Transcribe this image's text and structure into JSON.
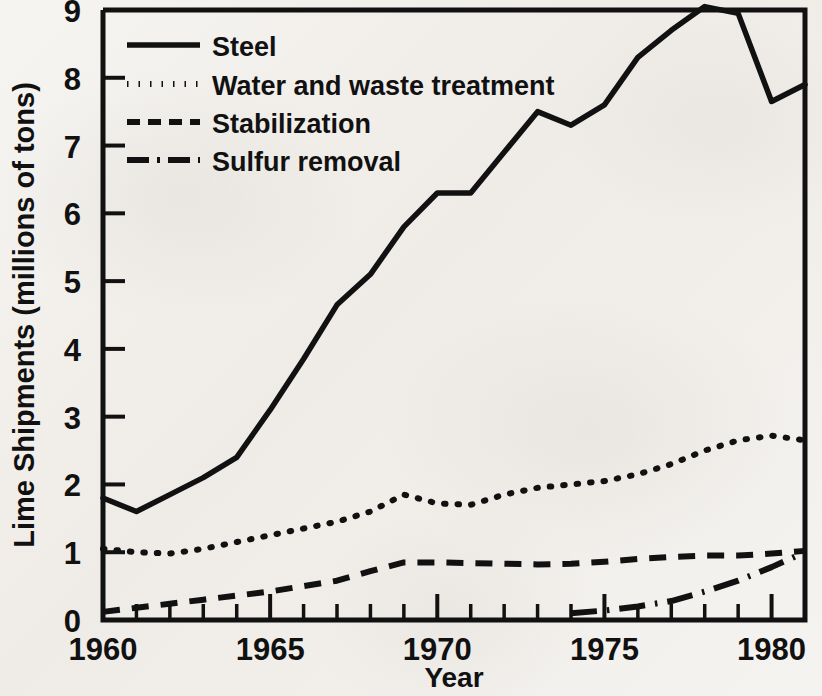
{
  "chart_data": {
    "type": "line",
    "title": "",
    "xlabel": "Year",
    "ylabel": "Lime Shipments (millions of tons)",
    "xlim": [
      1960,
      1981
    ],
    "ylim": [
      0,
      9
    ],
    "grid": false,
    "legend_position": "top-left",
    "x_tick_labels": [
      "1960",
      "1965",
      "1970",
      "1975",
      "1980"
    ],
    "x_tick_values": [
      1960,
      1965,
      1970,
      1975,
      1980
    ],
    "x_minor_tick_interval": 1,
    "y_tick_labels": [
      "0",
      "1",
      "2",
      "3",
      "4",
      "5",
      "6",
      "7",
      "8",
      "9"
    ],
    "y_tick_values": [
      0,
      1,
      2,
      3,
      4,
      5,
      6,
      7,
      8,
      9
    ],
    "x": [
      1960,
      1961,
      1962,
      1963,
      1964,
      1965,
      1966,
      1967,
      1968,
      1969,
      1970,
      1971,
      1972,
      1973,
      1974,
      1975,
      1976,
      1977,
      1978,
      1979,
      1980,
      1981
    ],
    "series": [
      {
        "name": "Steel",
        "line_style": "solid",
        "x": [
          1960,
          1961,
          1962,
          1963,
          1964,
          1965,
          1966,
          1967,
          1968,
          1969,
          1970,
          1971,
          1972,
          1973,
          1974,
          1975,
          1976,
          1977,
          1978,
          1979,
          1980,
          1981
        ],
        "values": [
          1.8,
          1.6,
          1.85,
          2.1,
          2.4,
          3.1,
          3.85,
          4.65,
          5.1,
          5.8,
          6.3,
          6.3,
          6.9,
          7.5,
          7.3,
          7.6,
          8.3,
          8.7,
          9.05,
          8.95,
          7.65,
          7.9
        ]
      },
      {
        "name": "Water and waste treatment",
        "line_style": "dotted",
        "x": [
          1960,
          1961,
          1962,
          1963,
          1964,
          1965,
          1966,
          1967,
          1968,
          1969,
          1970,
          1971,
          1972,
          1973,
          1974,
          1975,
          1976,
          1977,
          1978,
          1979,
          1980,
          1981
        ],
        "values": [
          1.05,
          1.0,
          0.98,
          1.05,
          1.15,
          1.25,
          1.35,
          1.45,
          1.6,
          1.85,
          1.72,
          1.7,
          1.85,
          1.95,
          2.0,
          2.05,
          2.15,
          2.3,
          2.5,
          2.65,
          2.72,
          2.65
        ]
      },
      {
        "name": "Stabilization",
        "line_style": "dashed",
        "x": [
          1960,
          1961,
          1962,
          1963,
          1964,
          1965,
          1966,
          1967,
          1968,
          1969,
          1970,
          1971,
          1972,
          1973,
          1974,
          1975,
          1976,
          1977,
          1978,
          1979,
          1980,
          1981
        ],
        "values": [
          0.12,
          0.18,
          0.24,
          0.3,
          0.36,
          0.42,
          0.5,
          0.58,
          0.72,
          0.85,
          0.85,
          0.84,
          0.83,
          0.82,
          0.83,
          0.86,
          0.9,
          0.93,
          0.95,
          0.95,
          0.98,
          1.02
        ]
      },
      {
        "name": "Sulfur removal",
        "line_style": "dash-dot",
        "x": [
          1974,
          1975,
          1976,
          1977,
          1978,
          1979,
          1980,
          1981
        ],
        "values": [
          0.1,
          0.14,
          0.2,
          0.28,
          0.42,
          0.58,
          0.78,
          1.0
        ]
      }
    ]
  },
  "legend": {
    "items": [
      {
        "label": "Steel",
        "style": "solid"
      },
      {
        "label": "Water and waste treatment",
        "style": "dotted"
      },
      {
        "label": "Stabilization",
        "style": "dashed"
      },
      {
        "label": "Sulfur removal",
        "style": "dash-dot"
      }
    ]
  },
  "axes": {
    "y_title": "Lime Shipments (millions of tons)",
    "x_title": "Year"
  }
}
